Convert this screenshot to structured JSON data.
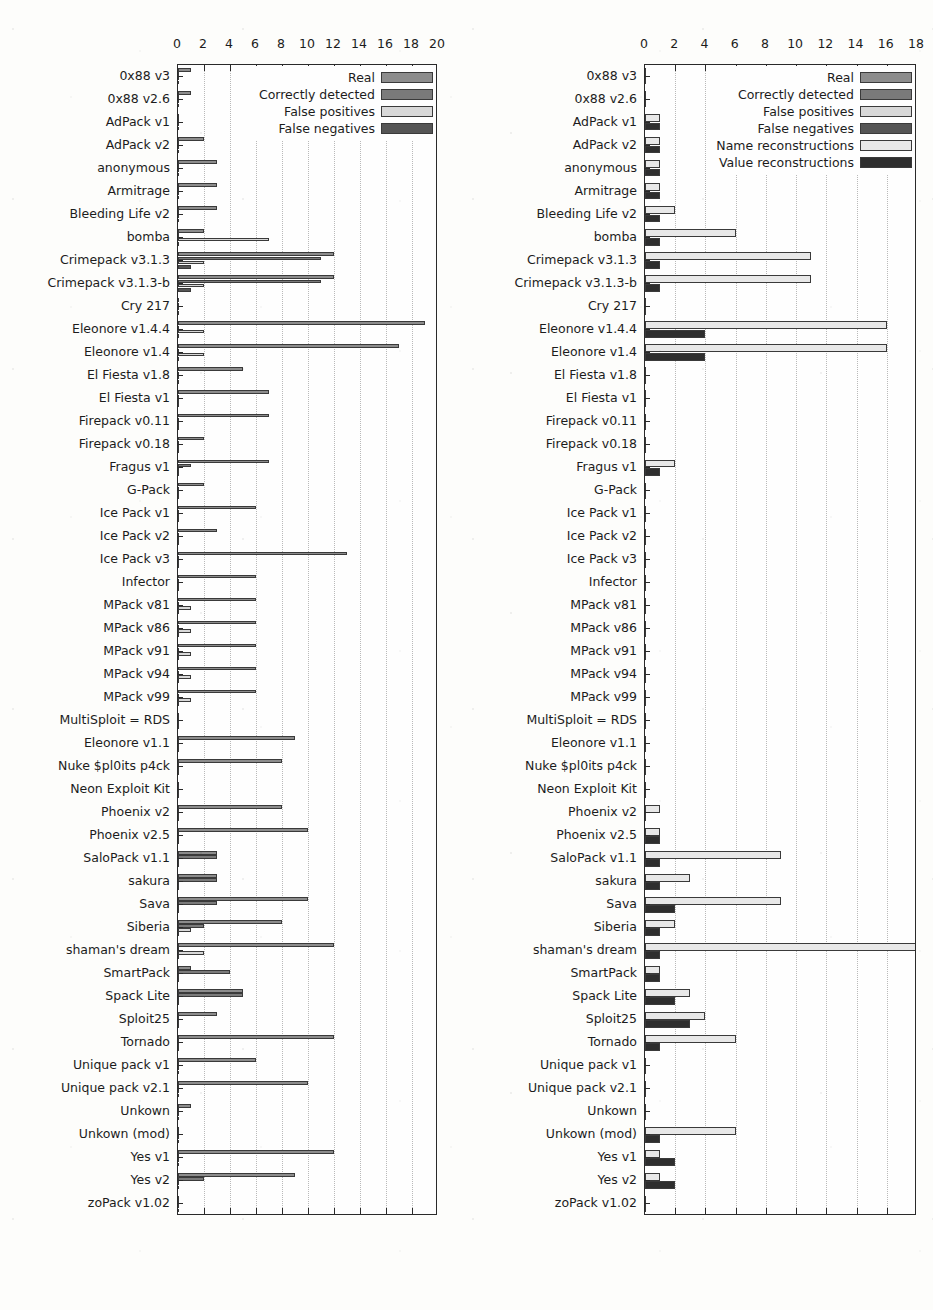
{
  "figure": {
    "panels": [
      {
        "id": "left",
        "name": "detection-chart",
        "legend": [
          {
            "label": "Real",
            "color": "#8c8c8c",
            "key": "real"
          },
          {
            "label": "Correctly detected",
            "color": "#7a7a7a",
            "key": "correct"
          },
          {
            "label": "False positives",
            "color": "#d8d8d8",
            "key": "fp"
          },
          {
            "label": "False negatives",
            "color": "#555555",
            "key": "fn"
          }
        ],
        "chart_data": {
          "type": "bar",
          "orientation": "horizontal",
          "title": "",
          "xlabel": "",
          "ylabel": "",
          "xlim": [
            0,
            20
          ],
          "xticks": [
            0,
            2,
            4,
            6,
            8,
            10,
            12,
            14,
            16,
            18,
            20
          ],
          "grid": true,
          "legend_position": "top-right",
          "categories": [
            "0x88 v3",
            "0x88 v2.6",
            "AdPack v1",
            "AdPack v2",
            "anonymous",
            "Armitrage",
            "Bleeding Life v2",
            "bomba",
            "Crimepack v3.1.3",
            "Crimepack v3.1.3-b",
            "Cry 217",
            "Eleonore v1.4.4",
            "Eleonore v1.4",
            "El Fiesta v1.8",
            "El Fiesta v1",
            "Firepack v0.11",
            "Firepack v0.18",
            "Fragus v1",
            "G-Pack",
            "Ice Pack v1",
            "Ice Pack v2",
            "Ice Pack v3",
            "Infector",
            "MPack v81",
            "MPack v86",
            "MPack v91",
            "MPack v94",
            "MPack v99",
            "MultiSploit = RDS",
            "Eleonore v1.1",
            "Nuke $pl0its p4ck",
            "Neon Exploit Kit",
            "Phoenix v2",
            "Phoenix v2.5",
            "SaloPack v1.1",
            "sakura",
            "Sava",
            "Siberia",
            "shaman's dream",
            "SmartPack",
            "Spack Lite",
            "Sploit25",
            "Tornado",
            "Unique pack v1",
            "Unique pack  v2.1",
            "Unkown",
            "Unkown (mod)",
            "Yes v1",
            "Yes v2",
            "zoPack v1.02"
          ],
          "series": [
            {
              "name": "Real",
              "values": [
                1,
                1,
                0,
                2,
                3,
                3,
                3,
                2,
                12,
                12,
                0,
                19,
                17,
                5,
                7,
                7,
                2,
                7,
                2,
                6,
                3,
                13,
                6,
                6,
                6,
                6,
                6,
                6,
                0,
                9,
                8,
                0,
                8,
                10,
                3,
                3,
                10,
                8,
                12,
                1,
                5,
                3,
                12,
                6,
                10,
                1,
                0,
                12,
                9,
                0
              ]
            },
            {
              "name": "Correctly detected",
              "values": [
                0,
                0,
                0,
                0,
                0,
                0,
                0,
                0,
                11,
                11,
                0,
                0,
                0,
                0,
                0,
                0,
                0,
                1,
                0,
                0,
                0,
                0,
                0,
                0,
                0,
                0,
                0,
                0,
                0,
                0,
                0,
                0,
                0,
                0,
                3,
                3,
                3,
                2,
                0,
                4,
                5,
                0,
                0,
                0,
                0,
                0,
                0,
                0,
                2,
                0
              ]
            },
            {
              "name": "False positives",
              "values": [
                0,
                0,
                0,
                0,
                0,
                0,
                0,
                7,
                2,
                2,
                0,
                2,
                2,
                0,
                0,
                0,
                0,
                0,
                0,
                0,
                0,
                0,
                0,
                1,
                1,
                1,
                1,
                1,
                0,
                0,
                0,
                0,
                0,
                0,
                0,
                0,
                0,
                1,
                2,
                0,
                0,
                0,
                0,
                0,
                0,
                0,
                0,
                0,
                0,
                0
              ]
            },
            {
              "name": "False negatives",
              "values": [
                0,
                0,
                0,
                0,
                0,
                0,
                0,
                0,
                1,
                1,
                0,
                0,
                0,
                0,
                0,
                0,
                0,
                0,
                0,
                0,
                0,
                0,
                0,
                0,
                0,
                0,
                0,
                0,
                0,
                0,
                0,
                0,
                0,
                0,
                0,
                0,
                0,
                0,
                0,
                0,
                0,
                0,
                0,
                0,
                0,
                0,
                0,
                0,
                0,
                0
              ]
            }
          ]
        }
      },
      {
        "id": "right",
        "name": "reconstruction-chart",
        "legend": [
          {
            "label": "Real",
            "color": "#8c8c8c",
            "key": "real"
          },
          {
            "label": "Correctly detected",
            "color": "#7a7a7a",
            "key": "correct"
          },
          {
            "label": "False positives",
            "color": "#d8d8d8",
            "key": "fp"
          },
          {
            "label": "False negatives",
            "color": "#555555",
            "key": "fn"
          },
          {
            "label": "Name reconstructions",
            "color": "#e8e8e8",
            "key": "name"
          },
          {
            "label": "Value reconstructions",
            "color": "#2e2e2e",
            "key": "value"
          }
        ],
        "chart_data": {
          "type": "bar",
          "orientation": "horizontal",
          "title": "",
          "xlabel": "",
          "ylabel": "",
          "xlim": [
            0,
            18
          ],
          "xticks": [
            0,
            2,
            4,
            6,
            8,
            10,
            12,
            14,
            16,
            18
          ],
          "grid": true,
          "legend_position": "top-right",
          "categories": [
            "0x88 v3",
            "0x88 v2.6",
            "AdPack v1",
            "AdPack v2",
            "anonymous",
            "Armitrage",
            "Bleeding Life v2",
            "bomba",
            "Crimepack v3.1.3",
            "Crimepack v3.1.3-b",
            "Cry 217",
            "Eleonore v1.4.4",
            "Eleonore v1.4",
            "El Fiesta v1.8",
            "El Fiesta v1",
            "Firepack v0.11",
            "Firepack v0.18",
            "Fragus v1",
            "G-Pack",
            "Ice Pack v1",
            "Ice Pack v2",
            "Ice Pack v3",
            "Infector",
            "MPack v81",
            "MPack v86",
            "MPack v91",
            "MPack v94",
            "MPack v99",
            "MultiSploit = RDS",
            "Eleonore v1.1",
            "Nuke $pl0its p4ck",
            "Neon Exploit Kit",
            "Phoenix v2",
            "Phoenix v2.5",
            "SaloPack v1.1",
            "sakura",
            "Sava",
            "Siberia",
            "shaman's dream",
            "SmartPack",
            "Spack Lite",
            "Sploit25",
            "Tornado",
            "Unique pack v1",
            "Unique pack  v2.1",
            "Unkown",
            "Unkown (mod)",
            "Yes v1",
            "Yes v2",
            "zoPack v1.02"
          ],
          "series": [
            {
              "name": "Name reconstructions",
              "values": [
                0,
                0,
                1,
                1,
                1,
                1,
                2,
                6,
                11,
                11,
                0,
                16,
                16,
                0,
                0,
                0,
                0,
                2,
                0,
                0,
                0,
                0,
                0,
                0,
                0,
                0,
                0,
                0,
                0,
                0,
                0,
                0,
                1,
                1,
                9,
                3,
                9,
                2,
                18,
                1,
                3,
                4,
                6,
                0,
                0,
                0,
                6,
                1,
                1,
                0
              ]
            },
            {
              "name": "Value reconstructions",
              "values": [
                0,
                0,
                1,
                1,
                1,
                1,
                1,
                1,
                1,
                1,
                0,
                4,
                4,
                0,
                0,
                0,
                0,
                1,
                0,
                0,
                0,
                0,
                0,
                0,
                0,
                0,
                0,
                0,
                0,
                0,
                0,
                0,
                0,
                1,
                1,
                1,
                2,
                1,
                1,
                1,
                2,
                3,
                1,
                0,
                0,
                0,
                1,
                2,
                2,
                0
              ]
            }
          ]
        }
      }
    ]
  }
}
